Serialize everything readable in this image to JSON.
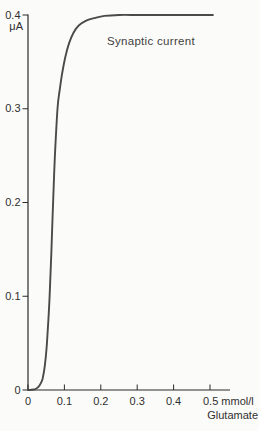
{
  "chart_data": {
    "type": "line",
    "title": "",
    "annotation": "Synaptic current",
    "ylabel": "μA",
    "xlabel": "Glutamate",
    "x_axis": {
      "min": 0,
      "max": 0.5,
      "unit": "mmol/l",
      "ticks": [
        {
          "value": 0,
          "label": "0"
        },
        {
          "value": 0.1,
          "label": "0.1"
        },
        {
          "value": 0.2,
          "label": "0.2"
        },
        {
          "value": 0.3,
          "label": "0.3"
        },
        {
          "value": 0.4,
          "label": "0.4"
        },
        {
          "value": 0.5,
          "label": "0.5 mmol/l",
          "anchor": "start"
        }
      ]
    },
    "y_axis": {
      "min": 0,
      "max": 0.4,
      "unit": "μA",
      "ticks": [
        {
          "value": 0,
          "label": "0"
        },
        {
          "value": 0.1,
          "label": "0.1"
        },
        {
          "value": 0.2,
          "label": "0.2"
        },
        {
          "value": 0.3,
          "label": "0.3"
        },
        {
          "value": 0.4,
          "label": "0.4"
        }
      ]
    },
    "grid": false,
    "legend": "none",
    "series": [
      {
        "name": "Synaptic current",
        "points": [
          [
            0,
            0
          ],
          [
            0.01,
            0.0003
          ],
          [
            0.02,
            0.001
          ],
          [
            0.028,
            0.003
          ],
          [
            0.035,
            0.007
          ],
          [
            0.04,
            0.012
          ],
          [
            0.046,
            0.025
          ],
          [
            0.051,
            0.045
          ],
          [
            0.056,
            0.075
          ],
          [
            0.06,
            0.105
          ],
          [
            0.064,
            0.145
          ],
          [
            0.069,
            0.2
          ],
          [
            0.074,
            0.25
          ],
          [
            0.081,
            0.3
          ],
          [
            0.087,
            0.32
          ],
          [
            0.094,
            0.338
          ],
          [
            0.103,
            0.356
          ],
          [
            0.113,
            0.37
          ],
          [
            0.125,
            0.381
          ],
          [
            0.14,
            0.389
          ],
          [
            0.16,
            0.394
          ],
          [
            0.185,
            0.397
          ],
          [
            0.21,
            0.399
          ],
          [
            0.25,
            0.4
          ],
          [
            0.3,
            0.4
          ],
          [
            0.35,
            0.4
          ],
          [
            0.4,
            0.4
          ],
          [
            0.45,
            0.4
          ],
          [
            0.508,
            0.4
          ]
        ]
      }
    ],
    "colors": {
      "background": "#fbfbf9",
      "axis": "#2b2b2b",
      "curve": "#4a4a4a",
      "text": "#2f2f2f"
    }
  }
}
